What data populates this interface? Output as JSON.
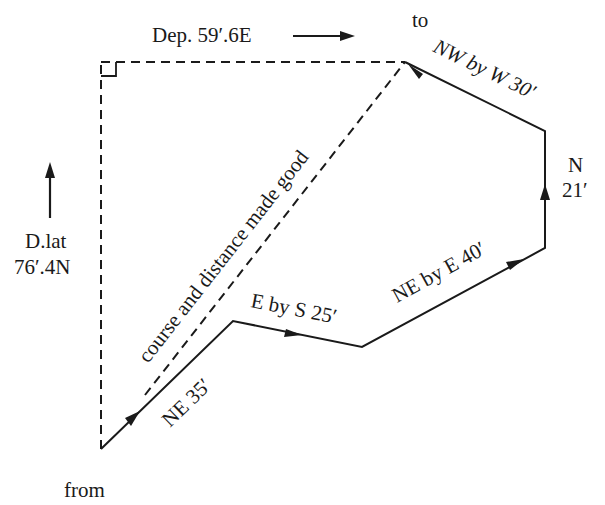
{
  "diagram": {
    "type": "traverse-sailing-diagram",
    "start_label": "from",
    "end_label": "to",
    "legs": [
      {
        "id": "leg-1",
        "course": "NE",
        "distance": "35′",
        "label": "NE 35′"
      },
      {
        "id": "leg-2",
        "course": "E by S",
        "distance": "25′",
        "label": "E by S 25′"
      },
      {
        "id": "leg-3",
        "course": "NE by E",
        "distance": "40′",
        "label": "NE by E 40′"
      },
      {
        "id": "leg-4",
        "course": "N",
        "distance": "21′",
        "label_line1": "N",
        "label_line2": "21′"
      },
      {
        "id": "leg-5",
        "course": "NW by W",
        "distance": "30′",
        "label": "NW by W 30′"
      }
    ],
    "resultant_label": "course and distance made good",
    "departure": {
      "label": "Dep. 59′.6E",
      "direction": "E"
    },
    "dlat": {
      "label_line1": "D.lat",
      "label_line2": "76′.4N",
      "direction": "N"
    }
  },
  "colors": {
    "ink": "#1a1a1a",
    "background": "#ffffff"
  }
}
